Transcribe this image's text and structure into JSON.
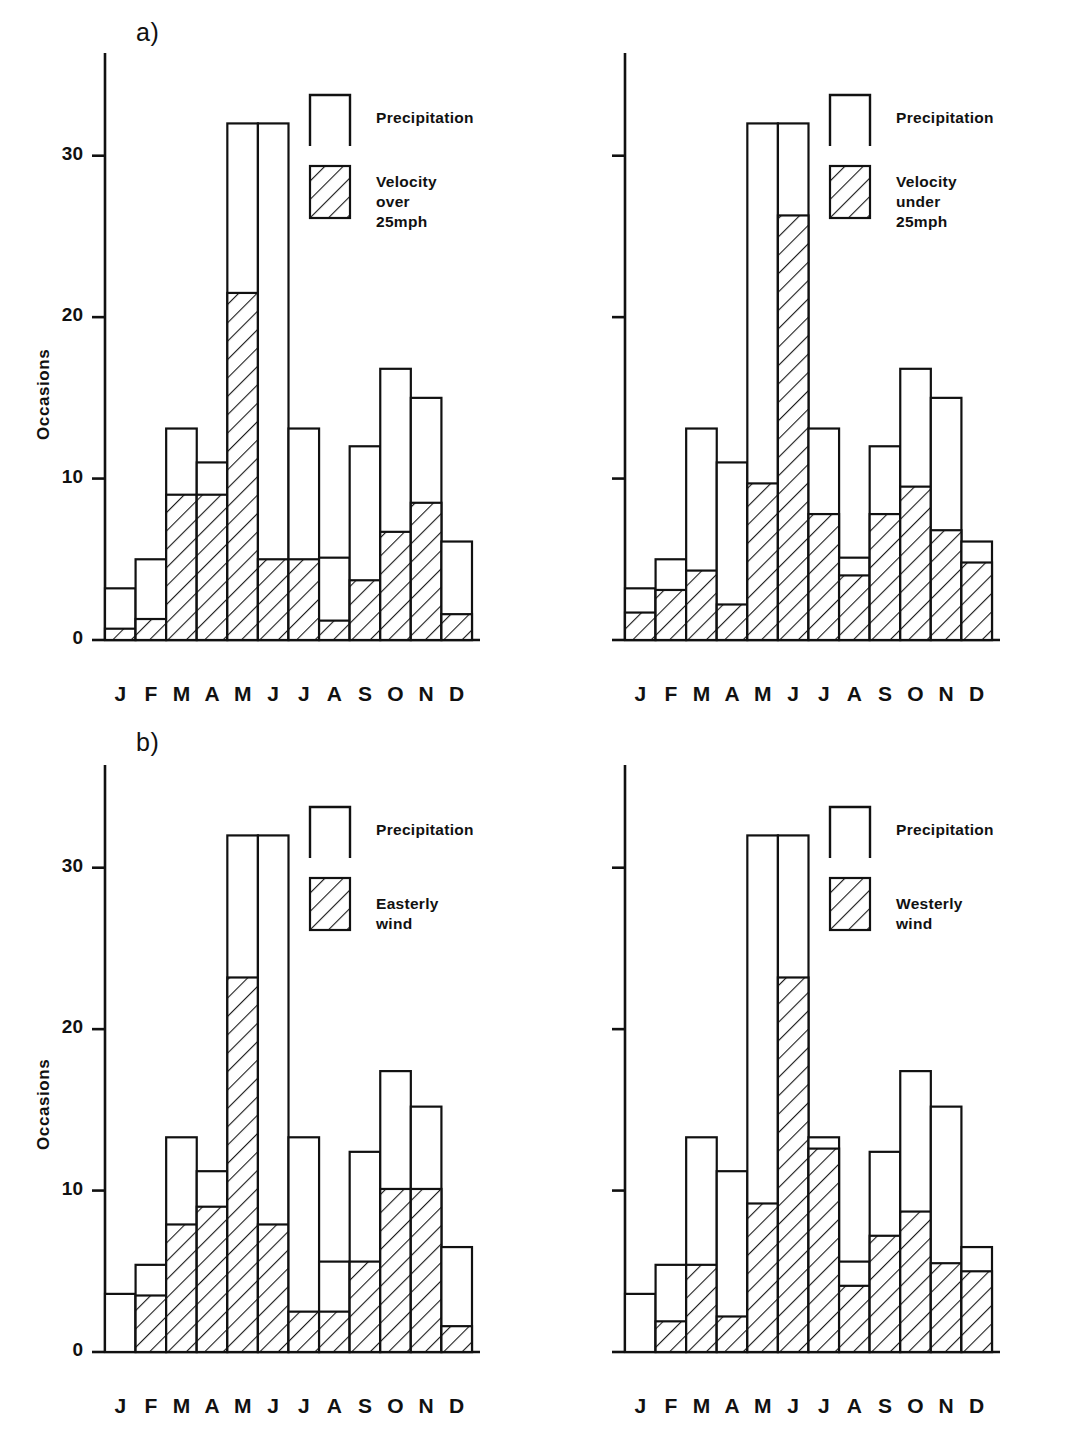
{
  "figure": {
    "panel_a_letter": "a)",
    "panel_b_letter": "b)",
    "y_axis_label": "Occasions",
    "caption": ""
  },
  "axis": {
    "y_ticks": [
      "0",
      "10",
      "20",
      "30"
    ],
    "y_tick_values": [
      0,
      10,
      20,
      30
    ],
    "y_min": 0,
    "y_max": 35,
    "x_tick_labels": [
      "J",
      "F",
      "M",
      "A",
      "M",
      "J",
      "J",
      "A",
      "S",
      "O",
      "N",
      "D"
    ]
  },
  "legends": {
    "a_left": {
      "item1": "Precipitation",
      "item2": "Velocity\nover 25mph"
    },
    "a_right": {
      "item1": "Precipitation",
      "item2": "Velocity\nunder 25mph"
    },
    "b_left": {
      "item1": "Precipitation",
      "item2": "Easterly wind"
    },
    "b_right": {
      "item1": "Precipitation",
      "item2": "Westerly wind"
    }
  },
  "chart_data": [
    {
      "id": "a-left",
      "type": "bar",
      "stacked": true,
      "title": "",
      "panel": "a)",
      "position": "left",
      "xlabel": "",
      "ylabel": "Occasions",
      "ylim": [
        0,
        35
      ],
      "grid": false,
      "legend_position": "upper-right",
      "categories": [
        "J",
        "F",
        "M",
        "A",
        "M",
        "J",
        "J",
        "A",
        "S",
        "O",
        "N",
        "D"
      ],
      "series": [
        {
          "name": "Velocity over 25mph",
          "fill": "hatch",
          "values": [
            0.7,
            1.3,
            9.0,
            9.0,
            21.5,
            5.0,
            5.0,
            1.2,
            3.7,
            6.7,
            8.5,
            1.6
          ]
        },
        {
          "name": "Precipitation",
          "fill": "open",
          "values": [
            3.2,
            5.0,
            13.1,
            11.0,
            32.0,
            32.0,
            13.1,
            5.1,
            12.0,
            16.8,
            15.0,
            6.1
          ]
        }
      ],
      "note": "Precipitation values are bar totals; hatched segment is drawn from 0 up to the velocity value."
    },
    {
      "id": "a-right",
      "type": "bar",
      "stacked": true,
      "title": "",
      "panel": "a)",
      "position": "right",
      "xlabel": "",
      "ylabel": "",
      "ylim": [
        0,
        35
      ],
      "grid": false,
      "legend_position": "upper-right",
      "categories": [
        "J",
        "F",
        "M",
        "A",
        "M",
        "J",
        "J",
        "A",
        "S",
        "O",
        "N",
        "D"
      ],
      "series": [
        {
          "name": "Velocity under 25mph",
          "fill": "hatch",
          "values": [
            1.7,
            3.1,
            4.3,
            2.2,
            9.7,
            26.3,
            7.8,
            4.0,
            7.8,
            9.5,
            6.8,
            4.8
          ]
        },
        {
          "name": "Precipitation",
          "fill": "open",
          "values": [
            3.2,
            5.0,
            13.1,
            11.0,
            32.0,
            32.0,
            13.1,
            5.1,
            12.0,
            16.8,
            15.0,
            6.1
          ]
        }
      ]
    },
    {
      "id": "b-left",
      "type": "bar",
      "stacked": true,
      "title": "",
      "panel": "b)",
      "position": "left",
      "xlabel": "",
      "ylabel": "Occasions",
      "ylim": [
        0,
        35
      ],
      "grid": false,
      "legend_position": "upper-right",
      "categories": [
        "J",
        "F",
        "M",
        "A",
        "M",
        "J",
        "J",
        "A",
        "S",
        "O",
        "N",
        "D"
      ],
      "series": [
        {
          "name": "Easterly wind",
          "fill": "hatch",
          "values": [
            0.0,
            3.5,
            7.9,
            9.0,
            23.2,
            7.9,
            2.5,
            2.5,
            5.6,
            10.1,
            10.1,
            1.6
          ]
        },
        {
          "name": "Precipitation",
          "fill": "open",
          "values": [
            3.6,
            5.4,
            13.3,
            11.2,
            32.0,
            32.0,
            13.3,
            5.6,
            12.4,
            17.4,
            15.2,
            6.5
          ]
        }
      ]
    },
    {
      "id": "b-right",
      "type": "bar",
      "stacked": true,
      "title": "",
      "panel": "b)",
      "position": "right",
      "xlabel": "",
      "ylabel": "",
      "ylim": [
        0,
        35
      ],
      "grid": false,
      "legend_position": "upper-right",
      "categories": [
        "J",
        "F",
        "M",
        "A",
        "M",
        "J",
        "J",
        "A",
        "S",
        "O",
        "N",
        "D"
      ],
      "series": [
        {
          "name": "Westerly wind",
          "fill": "hatch",
          "values": [
            0.0,
            1.9,
            5.4,
            2.2,
            9.2,
            23.2,
            12.6,
            4.1,
            7.2,
            8.7,
            5.5,
            5.0
          ]
        },
        {
          "name": "Precipitation",
          "fill": "open",
          "values": [
            3.6,
            5.4,
            13.3,
            11.2,
            32.0,
            32.0,
            13.3,
            5.6,
            12.4,
            17.4,
            15.2,
            6.5
          ]
        }
      ]
    }
  ]
}
